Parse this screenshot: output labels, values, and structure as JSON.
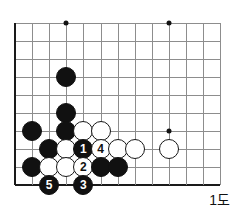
{
  "figure": {
    "caption": "1도",
    "board": {
      "origin_x": 15,
      "origin_y": 23,
      "col_step": 17.1,
      "row_step": 18.0,
      "cols": 13,
      "rows": 10,
      "line_color": "#8d8d8d",
      "edge_color": "#1a1a1a"
    },
    "star_points": [
      {
        "name": "star-point-upper-left",
        "col": 3,
        "row": 0
      },
      {
        "name": "star-point-upper-right",
        "col": 9,
        "row": 0
      },
      {
        "name": "star-point-lower-right",
        "col": 9,
        "row": 6
      }
    ],
    "stones": [
      {
        "name": "black-stone-d4",
        "color": "black",
        "col": 3,
        "row": 3,
        "label": ""
      },
      {
        "name": "black-stone-d6",
        "color": "black",
        "col": 3,
        "row": 5,
        "label": ""
      },
      {
        "name": "black-stone-d7",
        "color": "black",
        "col": 3,
        "row": 6,
        "label": ""
      },
      {
        "name": "black-stone-b7",
        "color": "black",
        "col": 1,
        "row": 6,
        "label": ""
      },
      {
        "name": "white-stone-e7",
        "color": "white",
        "col": 4,
        "row": 6,
        "label": ""
      },
      {
        "name": "white-stone-f7",
        "color": "white",
        "col": 5,
        "row": 6,
        "label": ""
      },
      {
        "name": "white-stone-j7",
        "color": "white",
        "col": 9,
        "row": 7,
        "label": ""
      },
      {
        "name": "black-stone-c8",
        "color": "black",
        "col": 2,
        "row": 7,
        "label": ""
      },
      {
        "name": "white-stone-d8",
        "color": "white",
        "col": 3,
        "row": 7,
        "label": ""
      },
      {
        "name": "black-stone-e8-move1",
        "color": "black",
        "col": 4,
        "row": 7,
        "label": "1"
      },
      {
        "name": "white-stone-f8-move4",
        "color": "white",
        "col": 5,
        "row": 7,
        "label": "4"
      },
      {
        "name": "white-stone-g8",
        "color": "white",
        "col": 6,
        "row": 7,
        "label": ""
      },
      {
        "name": "white-stone-h8",
        "color": "white",
        "col": 7,
        "row": 7,
        "label": ""
      },
      {
        "name": "black-stone-b9",
        "color": "black",
        "col": 1,
        "row": 8,
        "label": ""
      },
      {
        "name": "white-stone-c9",
        "color": "white",
        "col": 2,
        "row": 8,
        "label": ""
      },
      {
        "name": "white-stone-d9",
        "color": "white",
        "col": 3,
        "row": 8,
        "label": ""
      },
      {
        "name": "white-stone-e9-move2",
        "color": "white",
        "col": 4,
        "row": 8,
        "label": "2"
      },
      {
        "name": "black-stone-f9",
        "color": "black",
        "col": 5,
        "row": 8,
        "label": ""
      },
      {
        "name": "black-stone-g9",
        "color": "black",
        "col": 6,
        "row": 8,
        "label": ""
      },
      {
        "name": "black-stone-c10-move5",
        "color": "black",
        "col": 2,
        "row": 9,
        "label": "5"
      },
      {
        "name": "black-stone-e10-move3",
        "color": "black",
        "col": 4,
        "row": 9,
        "label": "3"
      }
    ]
  }
}
